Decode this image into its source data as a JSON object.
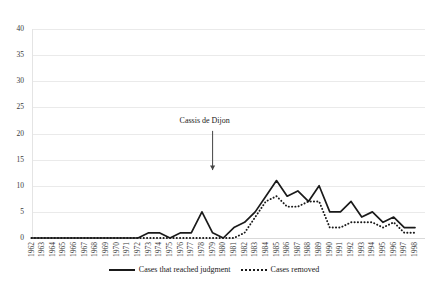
{
  "chart_data": {
    "type": "line",
    "title": "",
    "subtitle": "",
    "xlabel": "",
    "ylabel": "",
    "ylim": [
      0,
      40
    ],
    "yticks": [
      0,
      5,
      10,
      15,
      20,
      25,
      30,
      35,
      40
    ],
    "grid": true,
    "legend_position": "bottom-center",
    "x": [
      1962,
      1963,
      1964,
      1965,
      1966,
      1967,
      1968,
      1969,
      1970,
      1971,
      1972,
      1973,
      1974,
      1975,
      1976,
      1977,
      1978,
      1979,
      1980,
      1981,
      1982,
      1983,
      1984,
      1985,
      1986,
      1987,
      1988,
      1989,
      1990,
      1991,
      1992,
      1993,
      1994,
      1995,
      1996,
      1997,
      1998
    ],
    "categories": [
      "1962",
      "1963",
      "1964",
      "1965",
      "1966",
      "1967",
      "1968",
      "1969",
      "1970",
      "1971",
      "1972",
      "1973",
      "1974",
      "1975",
      "1976",
      "1977",
      "1978",
      "1979",
      "1980",
      "1981",
      "1982",
      "1983",
      "1984",
      "1985",
      "1986",
      "1987",
      "1988",
      "1989",
      "1990",
      "1991",
      "1992",
      "1993",
      "1994",
      "1995",
      "1996",
      "1997",
      "1998"
    ],
    "series": [
      {
        "name": "Cases that reached judgment",
        "style": "solid",
        "color": "#1a1a1a",
        "values": [
          0,
          0,
          0,
          0,
          0,
          0,
          0,
          0,
          0,
          0,
          0,
          1,
          1,
          0,
          1,
          1,
          5,
          1,
          0,
          2,
          3,
          5,
          8,
          11,
          8,
          9,
          7,
          10,
          5,
          5,
          7,
          4,
          5,
          3,
          4,
          2,
          2
        ]
      },
      {
        "name": "Cases removed",
        "style": "dotted",
        "color": "#1a1a1a",
        "values": [
          0,
          0,
          0,
          0,
          0,
          0,
          0,
          0,
          0,
          0,
          0,
          0,
          0,
          0,
          0,
          0,
          0,
          0,
          0,
          0,
          1,
          4,
          7,
          8,
          6,
          6,
          7,
          7,
          2,
          2,
          3,
          3,
          3,
          2,
          3,
          1,
          1
        ]
      }
    ],
    "annotations": [
      {
        "text": "Cassis de Dijon",
        "x_year": 1979,
        "arrow": "down",
        "arrow_from_value": 20.5,
        "arrow_to_value": 13.0
      }
    ]
  },
  "legend": {
    "items": [
      {
        "label": "Cases that reached judgment",
        "style": "solid"
      },
      {
        "label": "Cases removed",
        "style": "dotted"
      }
    ]
  },
  "axes": {
    "y_labels": [
      "40",
      "35",
      "30",
      "25",
      "20",
      "15",
      "10",
      "5",
      "0"
    ],
    "x_labels": [
      "1962",
      "1963",
      "1964",
      "1965",
      "1966",
      "1967",
      "1968",
      "1969",
      "1970",
      "1971",
      "1972",
      "1973",
      "1974",
      "1975",
      "1976",
      "1977",
      "1978",
      "1979",
      "1980",
      "1981",
      "1982",
      "1983",
      "1984",
      "1985",
      "1986",
      "1987",
      "1988",
      "1989",
      "1990",
      "1991",
      "1992",
      "1993",
      "1994",
      "1995",
      "1996",
      "1997",
      "1998"
    ]
  },
  "annotation": {
    "label": "Cassis de Dijon"
  }
}
